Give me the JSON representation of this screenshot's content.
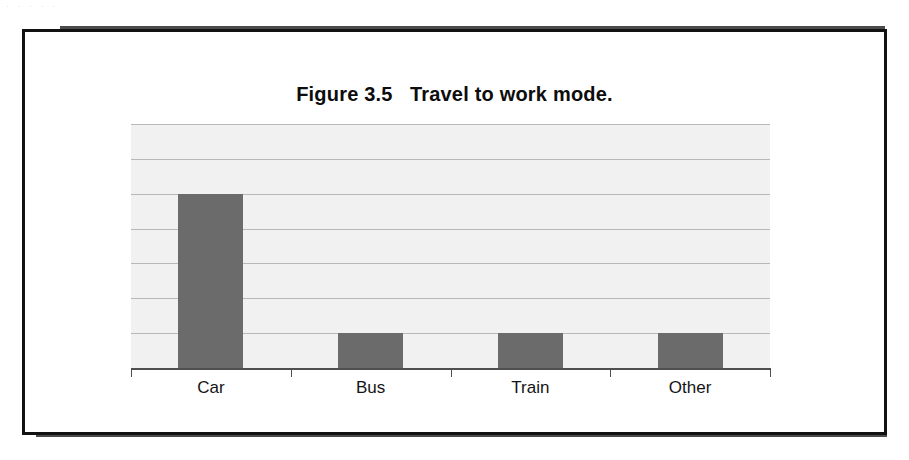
{
  "page": {
    "scan_remnant": "· ·   · · ·",
    "background_color": "#ffffff"
  },
  "figure": {
    "title": "Figure 3.5   Travel to work mode.",
    "frame_color": "#121212"
  },
  "chart_data": {
    "type": "bar",
    "title": "Figure 3.5   Travel to work mode.",
    "categories": [
      "Car",
      "Bus",
      "Train",
      "Other"
    ],
    "values": [
      5,
      1,
      1,
      1
    ],
    "xlabel": "",
    "ylabel": "",
    "ylim": [
      0,
      7
    ],
    "y_tick_count": 7,
    "y_tick_labels_visible": false,
    "grid": true,
    "gridline_color": "#b9b9b9",
    "plot_background": "#f1f1f1",
    "bar_color": "#6b6b6b",
    "legend": null,
    "legend_position": "none"
  }
}
